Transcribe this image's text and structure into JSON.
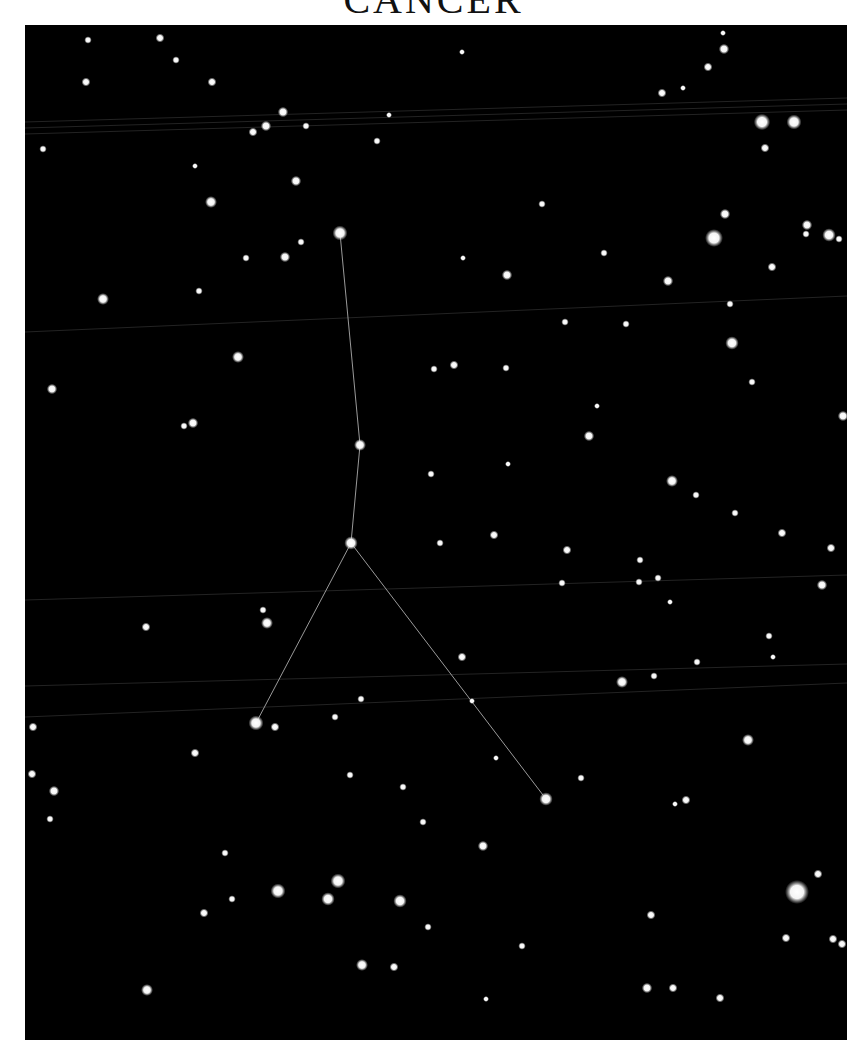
{
  "title": "CANCER",
  "colors": {
    "sky": "#000000",
    "star": "#ffffff",
    "line": "#9a9a9a",
    "page": "#ffffff"
  },
  "constellation": {
    "name": "Cancer",
    "stars": [
      {
        "id": "iota",
        "x": 340,
        "y": 233,
        "r": 5
      },
      {
        "id": "gamma",
        "x": 360,
        "y": 445,
        "r": 4
      },
      {
        "id": "delta",
        "x": 351,
        "y": 543,
        "r": 4.5
      },
      {
        "id": "alpha",
        "x": 256,
        "y": 723,
        "r": 5
      },
      {
        "id": "beta",
        "x": 546,
        "y": 799,
        "r": 4.5
      }
    ],
    "lines": [
      [
        "iota",
        "gamma"
      ],
      [
        "gamma",
        "delta"
      ],
      [
        "delta",
        "alpha"
      ],
      [
        "delta",
        "beta"
      ]
    ]
  },
  "stars": [
    [
      88,
      40,
      2.5
    ],
    [
      160,
      38,
      3
    ],
    [
      176,
      60,
      2.5
    ],
    [
      212,
      82,
      3
    ],
    [
      86,
      82,
      3
    ],
    [
      462,
      52,
      2
    ],
    [
      723,
      33,
      2
    ],
    [
      724,
      49,
      3.5
    ],
    [
      708,
      67,
      3
    ],
    [
      662,
      93,
      3
    ],
    [
      683,
      88,
      2
    ],
    [
      283,
      112,
      3.5
    ],
    [
      266,
      126,
      3.5
    ],
    [
      253,
      132,
      3
    ],
    [
      306,
      126,
      2.5
    ],
    [
      389,
      115,
      2
    ],
    [
      377,
      141,
      2.5
    ],
    [
      43,
      149,
      2.5
    ],
    [
      762,
      122,
      5.5
    ],
    [
      794,
      122,
      5
    ],
    [
      765,
      148,
      3
    ],
    [
      296,
      181,
      3.5
    ],
    [
      211,
      202,
      4
    ],
    [
      195,
      166,
      2
    ],
    [
      542,
      204,
      2.5
    ],
    [
      725,
      214,
      3.5
    ],
    [
      714,
      238,
      6
    ],
    [
      807,
      225,
      3.5
    ],
    [
      806,
      234,
      2.5
    ],
    [
      829,
      235,
      4.5
    ],
    [
      839,
      239,
      2.5
    ],
    [
      301,
      242,
      2.5
    ],
    [
      285,
      257,
      3.5
    ],
    [
      246,
      258,
      2.5
    ],
    [
      463,
      258,
      2
    ],
    [
      507,
      275,
      3.5
    ],
    [
      604,
      253,
      2.5
    ],
    [
      668,
      281,
      3.5
    ],
    [
      772,
      267,
      3
    ],
    [
      199,
      291,
      2.5
    ],
    [
      103,
      299,
      4
    ],
    [
      565,
      322,
      2.5
    ],
    [
      626,
      324,
      2.5
    ],
    [
      730,
      304,
      2.5
    ],
    [
      732,
      343,
      4.5
    ],
    [
      238,
      357,
      4
    ],
    [
      434,
      369,
      2.5
    ],
    [
      454,
      365,
      3
    ],
    [
      506,
      368,
      2.5
    ],
    [
      752,
      382,
      2.5
    ],
    [
      52,
      389,
      3.5
    ],
    [
      184,
      426,
      2.5
    ],
    [
      193,
      423,
      3.5
    ],
    [
      597,
      406,
      2
    ],
    [
      589,
      436,
      3.5
    ],
    [
      843,
      416,
      3.5
    ],
    [
      431,
      474,
      2.5
    ],
    [
      508,
      464,
      2
    ],
    [
      672,
      481,
      4
    ],
    [
      696,
      495,
      2.5
    ],
    [
      735,
      513,
      2.5
    ],
    [
      440,
      543,
      2.5
    ],
    [
      494,
      535,
      3
    ],
    [
      567,
      550,
      3
    ],
    [
      640,
      560,
      2.5
    ],
    [
      782,
      533,
      3
    ],
    [
      831,
      548,
      3
    ],
    [
      562,
      583,
      2.5
    ],
    [
      639,
      582,
      2.5
    ],
    [
      658,
      578,
      2.5
    ],
    [
      670,
      602,
      2
    ],
    [
      822,
      585,
      3.5
    ],
    [
      263,
      610,
      2.5
    ],
    [
      267,
      623,
      4
    ],
    [
      146,
      627,
      3
    ],
    [
      462,
      657,
      3
    ],
    [
      622,
      682,
      4
    ],
    [
      654,
      676,
      2.5
    ],
    [
      697,
      662,
      2.5
    ],
    [
      769,
      636,
      2.5
    ],
    [
      773,
      657,
      2
    ],
    [
      33,
      727,
      3
    ],
    [
      275,
      727,
      3
    ],
    [
      335,
      717,
      2.5
    ],
    [
      361,
      699,
      2.5
    ],
    [
      472,
      701,
      2
    ],
    [
      195,
      753,
      3
    ],
    [
      748,
      740,
      4
    ],
    [
      496,
      758,
      2
    ],
    [
      32,
      774,
      3
    ],
    [
      54,
      791,
      3.5
    ],
    [
      50,
      819,
      2.5
    ],
    [
      350,
      775,
      2.5
    ],
    [
      403,
      787,
      2.5
    ],
    [
      581,
      778,
      2.5
    ],
    [
      675,
      804,
      2
    ],
    [
      686,
      800,
      3
    ],
    [
      423,
      822,
      2.5
    ],
    [
      483,
      846,
      3.5
    ],
    [
      225,
      853,
      2.5
    ],
    [
      278,
      891,
      5
    ],
    [
      338,
      881,
      5
    ],
    [
      328,
      899,
      4.5
    ],
    [
      400,
      901,
      4.5
    ],
    [
      232,
      899,
      2.5
    ],
    [
      204,
      913,
      3
    ],
    [
      797,
      892,
      8
    ],
    [
      818,
      874,
      3
    ],
    [
      651,
      915,
      3
    ],
    [
      786,
      938,
      3
    ],
    [
      833,
      939,
      3
    ],
    [
      842,
      944,
      3
    ],
    [
      428,
      927,
      2.5
    ],
    [
      522,
      946,
      2.5
    ],
    [
      362,
      965,
      4
    ],
    [
      394,
      967,
      3
    ],
    [
      147,
      990,
      4
    ],
    [
      486,
      999,
      2
    ],
    [
      647,
      988,
      3.5
    ],
    [
      673,
      988,
      3
    ],
    [
      720,
      998,
      3
    ]
  ],
  "faint_lines": [
    {
      "x1": 25,
      "y1": 122,
      "x2": 847,
      "y2": 98
    },
    {
      "x1": 25,
      "y1": 128,
      "x2": 847,
      "y2": 104
    },
    {
      "x1": 25,
      "y1": 134,
      "x2": 847,
      "y2": 110
    },
    {
      "x1": 25,
      "y1": 332,
      "x2": 847,
      "y2": 296
    },
    {
      "x1": 25,
      "y1": 717,
      "x2": 847,
      "y2": 683
    },
    {
      "x1": 25,
      "y1": 600,
      "x2": 847,
      "y2": 575
    },
    {
      "x1": 25,
      "y1": 686,
      "x2": 847,
      "y2": 664
    }
  ]
}
